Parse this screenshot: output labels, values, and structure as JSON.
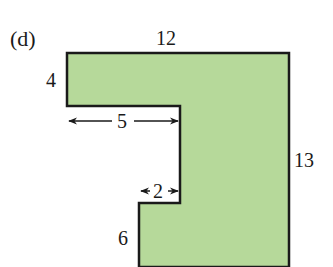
{
  "figure": {
    "label": "(d)",
    "fill_color": "#b6d99a",
    "stroke_color": "#1a1a1a",
    "dimensions": {
      "top": "12",
      "left_top": "4",
      "notch_width": "5",
      "right": "13",
      "step_width": "2",
      "bottom_left": "6"
    }
  }
}
